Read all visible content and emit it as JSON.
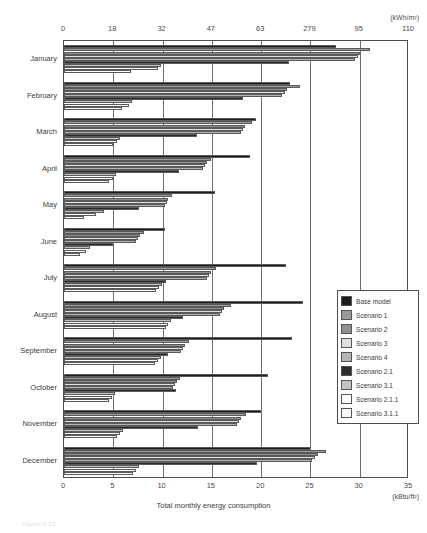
{
  "chart_data": {
    "type": "bar",
    "orientation": "horizontal",
    "title": "",
    "xlabel": "Total monthly energy consumption",
    "ylabel": "",
    "unit_top": "(kWh/m²)",
    "unit_bottom": "(kBtu/ft²)",
    "grid": true,
    "legend_position": "right",
    "xlim": [
      0,
      35
    ],
    "xticks_bottom": [
      "0",
      "5",
      "10",
      "15",
      "20",
      "25",
      "30",
      "35"
    ],
    "xtick_values_bottom": [
      0,
      5,
      10,
      15,
      20,
      25,
      30,
      35
    ],
    "xticks_top": [
      "0",
      "18",
      "32",
      "47",
      "63",
      "279",
      "95",
      "110"
    ],
    "xtick_values_top": [
      0,
      5,
      10,
      15,
      20,
      25,
      30,
      35
    ],
    "categories": [
      "January",
      "February",
      "March",
      "April",
      "May",
      "June",
      "July",
      "August",
      "September",
      "October",
      "November",
      "December"
    ],
    "series": [
      {
        "name": "Base model",
        "color": "#1c1c1c",
        "values": [
          27.6,
          22.9,
          19.5,
          18.9,
          15.3,
          10.2,
          22.5,
          24.2,
          23.1,
          20.7,
          20.0,
          25.0
        ]
      },
      {
        "name": "Scenario 1",
        "color": "#9a9a9a",
        "values": [
          31.0,
          23.9,
          19.1,
          14.9,
          11.0,
          8.1,
          15.4,
          16.9,
          12.7,
          11.8,
          18.5,
          26.6
        ]
      },
      {
        "name": "Scenario 2",
        "color": "#8f8f8f",
        "values": [
          30.0,
          22.6,
          18.4,
          14.5,
          10.6,
          7.7,
          14.9,
          16.2,
          12.3,
          11.5,
          18.0,
          25.8
        ]
      },
      {
        "name": "Scenario 3",
        "color": "#e0e0e0",
        "values": [
          29.8,
          22.4,
          18.2,
          14.3,
          10.4,
          7.5,
          14.7,
          16.0,
          12.1,
          11.3,
          17.8,
          25.5
        ]
      },
      {
        "name": "Scenario 4",
        "color": "#b4b4b4",
        "values": [
          29.5,
          22.1,
          18.0,
          14.1,
          10.2,
          7.3,
          14.5,
          15.8,
          11.9,
          11.1,
          17.5,
          25.2
        ]
      },
      {
        "name": "Scenario 2.1",
        "color": "#2b2b2b",
        "values": [
          22.8,
          18.2,
          13.5,
          11.7,
          7.6,
          5.0,
          10.3,
          12.1,
          10.6,
          11.4,
          13.6,
          19.6
        ]
      },
      {
        "name": "Scenario 3.1",
        "color": "#c3c3c3",
        "values": [
          9.8,
          6.9,
          5.7,
          5.3,
          4.1,
          2.6,
          9.9,
          10.9,
          9.8,
          5.2,
          6.0,
          7.6
        ]
      },
      {
        "name": "Scenario 2.1.1",
        "color": "#ffffff",
        "values": [
          9.5,
          6.6,
          5.4,
          5.0,
          3.2,
          2.2,
          9.6,
          10.6,
          9.5,
          4.9,
          5.7,
          7.3
        ]
      },
      {
        "name": "Scenario 3.1.1",
        "color": "#fdfdfd",
        "values": [
          6.8,
          5.9,
          5.0,
          4.6,
          2.0,
          1.6,
          9.3,
          10.3,
          9.2,
          4.6,
          5.4,
          7.0
        ]
      }
    ]
  },
  "legend": {
    "items": [
      {
        "label": "Base model"
      },
      {
        "label": "Scenario 1"
      },
      {
        "label": "Scenario 2"
      },
      {
        "label": "Scenario 3"
      },
      {
        "label": "Scenario 4"
      },
      {
        "label": "Scenario 2.1"
      },
      {
        "label": "Scenario 3.1"
      },
      {
        "label": "Scenario 2.1.1"
      },
      {
        "label": "Scenario 3.1.1"
      }
    ]
  },
  "caption": "Figure 4.23"
}
